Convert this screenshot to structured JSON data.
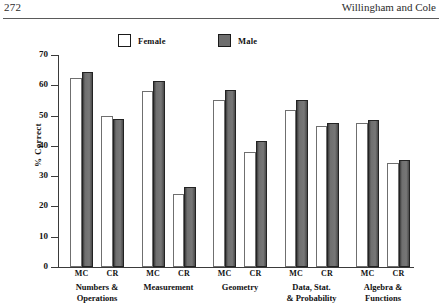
{
  "header": {
    "folio": "272",
    "running_title": "Willingham and Cole"
  },
  "chart_data": {
    "type": "bar",
    "title": "",
    "xlabel": "",
    "ylabel": "% Correct",
    "ylim": [
      0,
      70
    ],
    "yticks": [
      0,
      10,
      20,
      30,
      40,
      50,
      60,
      70
    ],
    "grid": false,
    "legend_position": "top",
    "groups": [
      {
        "name": "Numbers &\nOperations",
        "formats": [
          {
            "label": "MC",
            "female": 62.5,
            "male": 64.5
          },
          {
            "label": "CR",
            "female": 50.0,
            "male": 49.0
          }
        ]
      },
      {
        "name": "Measurement",
        "formats": [
          {
            "label": "MC",
            "female": 58.0,
            "male": 61.5
          },
          {
            "label": "CR",
            "female": 24.0,
            "male": 26.5
          }
        ]
      },
      {
        "name": "Geometry",
        "formats": [
          {
            "label": "MC",
            "female": 55.0,
            "male": 58.5
          },
          {
            "label": "CR",
            "female": 38.0,
            "male": 41.5
          }
        ]
      },
      {
        "name": "Data, Stat.\n& Probability",
        "formats": [
          {
            "label": "MC",
            "female": 52.0,
            "male": 55.0
          },
          {
            "label": "CR",
            "female": 46.5,
            "male": 47.5
          }
        ]
      },
      {
        "name": "Algebra &\nFunctions",
        "formats": [
          {
            "label": "MC",
            "female": 47.5,
            "male": 48.5
          },
          {
            "label": "CR",
            "female": 34.5,
            "male": 35.5
          }
        ]
      }
    ],
    "series": [
      {
        "name": "Female",
        "color": "#ffffff",
        "values": [
          62.5,
          50.0,
          58.0,
          24.0,
          55.0,
          38.0,
          52.0,
          46.5,
          47.5,
          34.5
        ]
      },
      {
        "name": "Male",
        "color": "#6e6e6e",
        "values": [
          64.5,
          49.0,
          61.5,
          26.5,
          58.5,
          41.5,
          55.0,
          47.5,
          48.5,
          35.5
        ]
      }
    ],
    "categories": [
      "Numbers & Operations MC",
      "Numbers & Operations CR",
      "Measurement MC",
      "Measurement CR",
      "Geometry MC",
      "Geometry CR",
      "Data, Stat. & Probability MC",
      "Data, Stat. & Probability CR",
      "Algebra & Functions MC",
      "Algebra & Functions CR"
    ]
  },
  "legend": {
    "entries": [
      {
        "label": "Female",
        "color": "#ffffff"
      },
      {
        "label": "Male",
        "color": "#6e6e6e"
      }
    ]
  }
}
